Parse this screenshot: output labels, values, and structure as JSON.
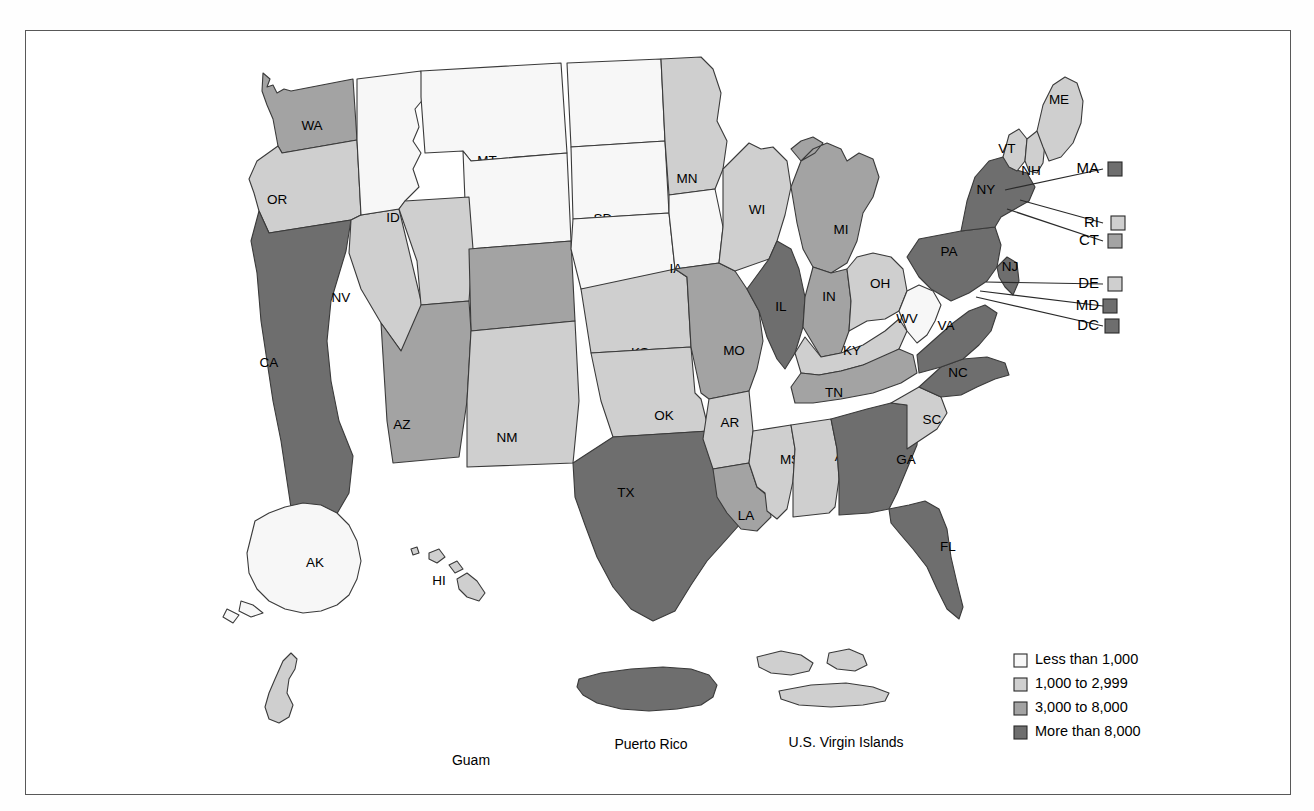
{
  "figure": {
    "type": "choropleth-map",
    "region": "United States and Territories",
    "background_color": "#ffffff",
    "frame_color": "#585858"
  },
  "palette": {
    "bin1": "#f7f7f7",
    "bin2": "#cfcfcf",
    "bin3": "#a3a3a3",
    "bin4": "#6e6e6e",
    "outline": "#3a3a3a"
  },
  "legend": {
    "items": [
      {
        "label": "Less than 1,000",
        "color_key": "bin1",
        "color": "#f7f7f7"
      },
      {
        "label": "1,000 to 2,999",
        "color_key": "bin2",
        "color": "#cfcfcf"
      },
      {
        "label": "3,000 to 8,000",
        "color_key": "bin3",
        "color": "#a3a3a3"
      },
      {
        "label": "More than 8,000",
        "color_key": "bin4",
        "color": "#6e6e6e"
      }
    ]
  },
  "chart_data": {
    "type": "heatmap",
    "title": "",
    "xlabel": "",
    "ylabel": "",
    "legend_position": "bottom-right",
    "bins": [
      {
        "index": 1,
        "label": "Less than 1,000",
        "color": "#f7f7f7"
      },
      {
        "index": 2,
        "label": "1,000 to 2,999",
        "color": "#cfcfcf"
      },
      {
        "index": 3,
        "label": "3,000 to 8,000",
        "color": "#a3a3a3"
      },
      {
        "index": 4,
        "label": "More than 8,000",
        "color": "#6e6e6e"
      }
    ],
    "categories": [
      "WA",
      "OR",
      "CA",
      "NV",
      "ID",
      "MT",
      "WY",
      "UT",
      "CO",
      "AZ",
      "NM",
      "ND",
      "SD",
      "NE",
      "KS",
      "OK",
      "TX",
      "MN",
      "IA",
      "MO",
      "AR",
      "LA",
      "WI",
      "IL",
      "MI",
      "IN",
      "OH",
      "KY",
      "TN",
      "MS",
      "AL",
      "GA",
      "FL",
      "SC",
      "NC",
      "VA",
      "WV",
      "PA",
      "NY",
      "VT",
      "NH",
      "ME",
      "MA",
      "RI",
      "CT",
      "NJ",
      "DE",
      "MD",
      "DC",
      "AK",
      "HI",
      "GU",
      "PR",
      "VI"
    ],
    "values": [
      3,
      2,
      4,
      2,
      1,
      1,
      1,
      2,
      3,
      3,
      2,
      1,
      1,
      1,
      2,
      2,
      4,
      2,
      1,
      3,
      2,
      3,
      2,
      4,
      3,
      3,
      2,
      2,
      3,
      2,
      2,
      4,
      4,
      2,
      4,
      4,
      1,
      4,
      4,
      2,
      2,
      2,
      4,
      2,
      3,
      4,
      2,
      4,
      4,
      1,
      2,
      2,
      4,
      2
    ]
  },
  "states": [
    {
      "code": "WA",
      "bin": 3,
      "label_x": 311,
      "label_y": 125
    },
    {
      "code": "OR",
      "bin": 2,
      "label_x": 276,
      "label_y": 199
    },
    {
      "code": "CA",
      "bin": 4,
      "label_x": 268,
      "label_y": 362
    },
    {
      "code": "NV",
      "bin": 2,
      "label_x": 340,
      "label_y": 297
    },
    {
      "code": "ID",
      "bin": 1,
      "label_x": 392,
      "label_y": 217
    },
    {
      "code": "MT",
      "bin": 1,
      "label_x": 486,
      "label_y": 160
    },
    {
      "code": "WY",
      "bin": 1,
      "label_x": 494,
      "label_y": 251
    },
    {
      "code": "UT",
      "bin": 2,
      "label_x": 421,
      "label_y": 327
    },
    {
      "code": "CO",
      "bin": 3,
      "label_x": 524,
      "label_y": 341
    },
    {
      "code": "AZ",
      "bin": 3,
      "label_x": 401,
      "label_y": 424
    },
    {
      "code": "NM",
      "bin": 2,
      "label_x": 506,
      "label_y": 437
    },
    {
      "code": "ND",
      "bin": 1,
      "label_x": 600,
      "label_y": 153
    },
    {
      "code": "SD",
      "bin": 1,
      "label_x": 602,
      "label_y": 218
    },
    {
      "code": "NE",
      "bin": 1,
      "label_x": 610,
      "label_y": 292
    },
    {
      "code": "KS",
      "bin": 2,
      "label_x": 639,
      "label_y": 352
    },
    {
      "code": "OK",
      "bin": 2,
      "label_x": 663,
      "label_y": 415
    },
    {
      "code": "TX",
      "bin": 4,
      "label_x": 625,
      "label_y": 492
    },
    {
      "code": "MN",
      "bin": 2,
      "label_x": 686,
      "label_y": 178
    },
    {
      "code": "IA",
      "bin": 1,
      "label_x": 675,
      "label_y": 268
    },
    {
      "code": "MO",
      "bin": 3,
      "label_x": 733,
      "label_y": 350
    },
    {
      "code": "AR",
      "bin": 2,
      "label_x": 729,
      "label_y": 422
    },
    {
      "code": "LA",
      "bin": 3,
      "label_x": 745,
      "label_y": 515
    },
    {
      "code": "WI",
      "bin": 2,
      "label_x": 756,
      "label_y": 209
    },
    {
      "code": "IL",
      "bin": 4,
      "label_x": 780,
      "label_y": 306
    },
    {
      "code": "MI",
      "bin": 3,
      "label_x": 840,
      "label_y": 229
    },
    {
      "code": "IN",
      "bin": 3,
      "label_x": 828,
      "label_y": 296
    },
    {
      "code": "OH",
      "bin": 2,
      "label_x": 879,
      "label_y": 283
    },
    {
      "code": "KY",
      "bin": 2,
      "label_x": 851,
      "label_y": 350
    },
    {
      "code": "TN",
      "bin": 3,
      "label_x": 833,
      "label_y": 392
    },
    {
      "code": "MS",
      "bin": 2,
      "label_x": 789,
      "label_y": 459
    },
    {
      "code": "AL",
      "bin": 2,
      "label_x": 842,
      "label_y": 456
    },
    {
      "code": "GA",
      "bin": 4,
      "label_x": 905,
      "label_y": 459
    },
    {
      "code": "FL",
      "bin": 4,
      "label_x": 947,
      "label_y": 546
    },
    {
      "code": "SC",
      "bin": 2,
      "label_x": 931,
      "label_y": 419
    },
    {
      "code": "NC",
      "bin": 4,
      "label_x": 957,
      "label_y": 372
    },
    {
      "code": "VA",
      "bin": 4,
      "label_x": 945,
      "label_y": 325
    },
    {
      "code": "WV",
      "bin": 1,
      "label_x": 906,
      "label_y": 318
    },
    {
      "code": "PA",
      "bin": 4,
      "label_x": 948,
      "label_y": 251
    },
    {
      "code": "NY",
      "bin": 4,
      "label_x": 985,
      "label_y": 189
    },
    {
      "code": "VT",
      "bin": 2,
      "label_x": 1006,
      "label_y": 148
    },
    {
      "code": "NH",
      "bin": 2,
      "label_x": 1030,
      "label_y": 170
    },
    {
      "code": "ME",
      "bin": 2,
      "label_x": 1058,
      "label_y": 99
    },
    {
      "code": "NJ",
      "bin": 4,
      "label_x": 1009,
      "label_y": 266
    },
    {
      "code": "AK",
      "bin": 1,
      "label_x": 314,
      "label_y": 562
    },
    {
      "code": "HI",
      "bin": 2,
      "label_x": 438,
      "label_y": 580
    }
  ],
  "callouts": [
    {
      "code": "MA",
      "bin": 4,
      "label_x": 1098,
      "label_y": 168,
      "swatch_x": 1107,
      "swatch_y": 161,
      "line_to_x": 1004,
      "line_to_y": 189
    },
    {
      "code": "RI",
      "bin": 2,
      "label_x": 1098,
      "label_y": 222,
      "swatch_x": 1110,
      "swatch_y": 215,
      "line_to_x": 1019,
      "line_to_y": 199
    },
    {
      "code": "CT",
      "bin": 3,
      "label_x": 1098,
      "label_y": 240,
      "swatch_x": 1107,
      "swatch_y": 233,
      "line_to_x": 1006,
      "line_to_y": 208
    },
    {
      "code": "DE",
      "bin": 2,
      "label_x": 1098,
      "label_y": 283,
      "swatch_x": 1107,
      "swatch_y": 276,
      "line_to_x": 985,
      "line_to_y": 281
    },
    {
      "code": "MD",
      "bin": 4,
      "label_x": 1098,
      "label_y": 305,
      "swatch_x": 1102,
      "swatch_y": 298,
      "line_to_x": 979,
      "line_to_y": 290
    },
    {
      "code": "DC",
      "bin": 4,
      "label_x": 1098,
      "label_y": 325,
      "swatch_x": 1104,
      "swatch_y": 318,
      "line_to_x": 975,
      "line_to_y": 296
    }
  ],
  "territories": [
    {
      "code": "GU",
      "name": "Guam",
      "bin": 2,
      "label_x": 470,
      "label_y": 760
    },
    {
      "code": "PR",
      "name": "Puerto Rico",
      "bin": 4,
      "label_x": 650,
      "label_y": 744
    },
    {
      "code": "VI",
      "name": "U.S. Virgin Islands",
      "bin": 2,
      "label_x": 845,
      "label_y": 742
    }
  ]
}
